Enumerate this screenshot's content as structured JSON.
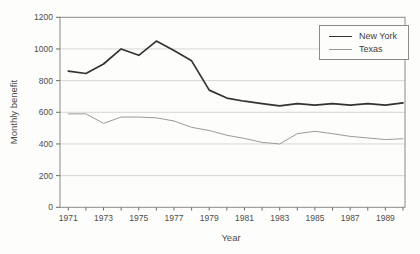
{
  "chart_data": {
    "type": "line",
    "title": "",
    "xlabel": "Year",
    "ylabel": "Monthly benefit",
    "xlim": [
      1971,
      1990
    ],
    "ylim": [
      0,
      1200
    ],
    "grid": "horizontal",
    "legend_position": "top-right",
    "x": [
      1971,
      1972,
      1973,
      1974,
      1975,
      1976,
      1977,
      1978,
      1979,
      1980,
      1981,
      1982,
      1983,
      1984,
      1985,
      1986,
      1987,
      1988,
      1989,
      1990
    ],
    "x_tick_labels": [
      "1971",
      "1973",
      "1975",
      "1977",
      "1979",
      "1981",
      "1983",
      "1985",
      "1987",
      "1989"
    ],
    "x_tick_label_years": [
      1971,
      1973,
      1975,
      1977,
      1979,
      1981,
      1983,
      1985,
      1987,
      1989
    ],
    "y_ticks": [
      0,
      200,
      400,
      600,
      800,
      1000,
      1200
    ],
    "y_tick_labels": [
      "0",
      "200",
      "400",
      "600",
      "800",
      "1000",
      "1200"
    ],
    "series": [
      {
        "name": "New York",
        "color": "#333333",
        "stroke_width": 1.7,
        "values": [
          860,
          845,
          905,
          1000,
          960,
          1050,
          990,
          925,
          740,
          690,
          670,
          655,
          640,
          655,
          645,
          655,
          645,
          655,
          645,
          660
        ]
      },
      {
        "name": "Texas",
        "color": "#9a9a9a",
        "stroke_width": 1,
        "values": [
          590,
          590,
          530,
          570,
          570,
          565,
          545,
          505,
          485,
          455,
          435,
          410,
          400,
          465,
          480,
          465,
          448,
          438,
          428,
          433
        ]
      }
    ]
  },
  "colors": {
    "background": "#fdfdfc",
    "frame": "#8a8a8a",
    "grid": "#cccccc",
    "tick": "#6a6a6a",
    "text": "#4d4d4d"
  }
}
